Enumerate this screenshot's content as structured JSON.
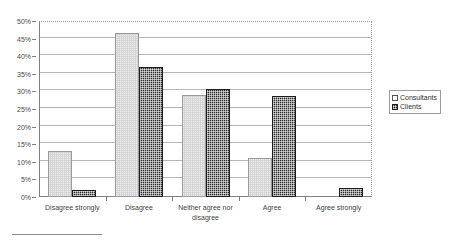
{
  "chart_data": {
    "type": "bar",
    "title": "",
    "xlabel": "",
    "ylabel": "",
    "ylim": [
      0,
      50
    ],
    "ytick_step": 5,
    "ytick_labels": [
      "0%",
      "5%",
      "10%",
      "15%",
      "20%",
      "25%",
      "30%",
      "35%",
      "40%",
      "45%",
      "50%"
    ],
    "grid": true,
    "legend_position": "right",
    "categories": [
      "Disagree strongly",
      "Disagree",
      "Neither agree nor disagree",
      "Agree",
      "Agree strongly"
    ],
    "series": [
      {
        "name": "Consultants",
        "values": [
          13.2,
          46.6,
          29.0,
          11.2,
          0.0
        ],
        "color": "#efefef"
      },
      {
        "name": "Clients",
        "values": [
          2.1,
          36.8,
          30.7,
          28.7,
          2.5
        ],
        "color": "#2e2e2e"
      }
    ]
  },
  "legend": {
    "items": [
      {
        "label": "Consultants"
      },
      {
        "label": "Clients"
      }
    ]
  },
  "title_remnant": {
    "text": ""
  }
}
